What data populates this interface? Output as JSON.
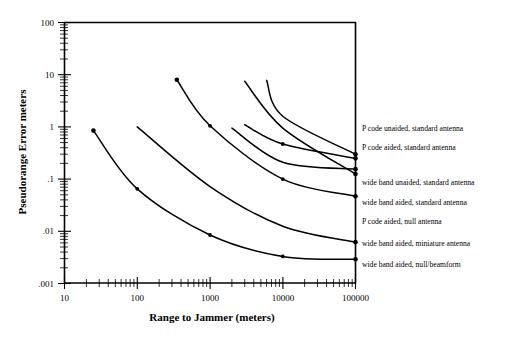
{
  "chart_data": {
    "type": "line",
    "title": "",
    "xlabel": "Range to Jammer (meters)",
    "ylabel": "Pseudorange Error meters",
    "xscale": "log",
    "yscale": "log",
    "xlim": [
      10,
      100000
    ],
    "ylim": [
      0.001,
      100
    ],
    "xticklabels": [
      "10",
      "100",
      "1000",
      "10000",
      "100000"
    ],
    "xtickvalues": [
      10,
      100,
      1000,
      10000,
      100000
    ],
    "yticklabels": [
      "100",
      "10",
      "1",
      ".1",
      ".01",
      ".001"
    ],
    "ytickvalues": [
      100,
      10,
      1,
      0.1,
      0.01,
      0.001
    ],
    "grid": false,
    "legend_position": "right-inline",
    "series": [
      {
        "name": "P code unaided, standard antenna",
        "x": [
          25,
          100,
          1000,
          10000,
          100000
        ],
        "y": [
          0.85,
          0.065,
          0.0085,
          0.0033,
          0.0029
        ],
        "markers": [
          true,
          true,
          true,
          true,
          true
        ]
      },
      {
        "name": "P code aided, standard antenna",
        "x": [
          100,
          1000,
          10000,
          100000
        ],
        "y": [
          1.0,
          0.072,
          0.0125,
          0.0062
        ],
        "markers": [
          false,
          false,
          false,
          true
        ]
      },
      {
        "name": "wide band unaided, standard antenna",
        "x": [
          350,
          1000,
          10000,
          100000
        ],
        "y": [
          8.0,
          1.05,
          0.1,
          0.047
        ],
        "markers": [
          true,
          true,
          true,
          true
        ]
      },
      {
        "name": "wide band aided, standard antenna",
        "x": [
          3000,
          10000,
          100000
        ],
        "y": [
          7.5,
          0.95,
          0.125
        ],
        "markers": [
          false,
          false,
          true
        ]
      },
      {
        "name": "P code aided, null antenna",
        "x": [
          6000,
          10000,
          100000
        ],
        "y": [
          7.8,
          1.6,
          0.3
        ],
        "markers": [
          false,
          false,
          true
        ]
      },
      {
        "name": "wide band aided, miniature antenna",
        "x": [
          3000,
          10000,
          100000
        ],
        "y": [
          1.1,
          0.47,
          0.25
        ],
        "markers": [
          false,
          true,
          true
        ]
      },
      {
        "name": "wide band aided, null/beamform",
        "x": [
          2000,
          10000,
          100000
        ],
        "y": [
          0.95,
          0.21,
          0.155
        ],
        "markers": [
          false,
          false,
          true
        ]
      }
    ],
    "legend_entries": [
      "P code unaided, standard  antenna",
      "P code aided, standard  antenna",
      "wide band unaided, standard  antenna",
      "wide band aided, standard  antenna",
      "P code aided, null antenna",
      "wide band aided, miniature  antenna",
      "wide band aided, null/beamform"
    ]
  },
  "axes": {
    "xlabel": "Range to Jammer (meters)",
    "ylabel": "Pseudorange Error meters",
    "x_tick_0": "10",
    "x_tick_1": "100",
    "x_tick_2": "1000",
    "x_tick_3": "10000",
    "x_tick_4": "100000",
    "y_tick_0": "100",
    "y_tick_1": "10",
    "y_tick_2": "1",
    "y_tick_3": ".1",
    "y_tick_4": ".01",
    "y_tick_5": ".001"
  },
  "legend": {
    "item_0": "P code unaided, standard  antenna",
    "item_1": "P code aided, standard  antenna",
    "item_2": "wide band unaided, standard  antenna",
    "item_3": "wide band aided, standard  antenna",
    "item_4": "P code aided, null antenna",
    "item_5": "wide band aided, miniature  antenna",
    "item_6": "wide band aided, null/beamform"
  },
  "colors": {
    "line": "#000000",
    "background": "#ffffff",
    "axis": "#000000"
  }
}
